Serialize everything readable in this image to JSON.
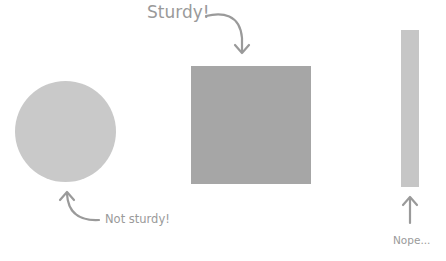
{
  "shapes": [
    {
      "kind": "circle",
      "color": "#c9c9c9",
      "caption": "Not sturdy!"
    },
    {
      "kind": "square",
      "color": "#a6a6a6",
      "caption": "Sturdy!"
    },
    {
      "kind": "tall-bar",
      "color": "#c6c6c6",
      "caption": "Nope..."
    }
  ],
  "labels": {
    "sturdy": "Sturdy!",
    "not_sturdy": "Not sturdy!",
    "nope": "Nope..."
  },
  "colors": {
    "text": "#9a9a9a",
    "arrow": "#9a9a9a"
  }
}
